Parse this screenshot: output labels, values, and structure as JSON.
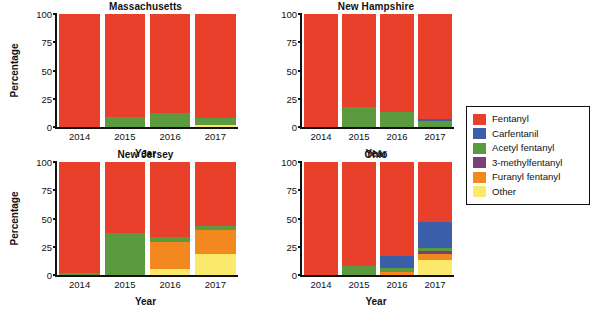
{
  "axes": {
    "ylabel": "Percentage",
    "xlabel": "Year",
    "yticks": [
      "100",
      "75",
      "50",
      "25",
      "0"
    ],
    "ytick_values": [
      100,
      75,
      50,
      25,
      0
    ],
    "xticks": [
      "2014",
      "2015",
      "2016",
      "2017"
    ]
  },
  "legend": {
    "title": "",
    "items": [
      {
        "label": "Fentanyl",
        "color": "#e8402a"
      },
      {
        "label": "Carfentanil",
        "color": "#3b5fa8"
      },
      {
        "label": "Acetyl fentanyl",
        "color": "#5b9a3e"
      },
      {
        "label": "3-methylfentanyl",
        "color": "#7b3f78"
      },
      {
        "label": "Furanyl fentanyl",
        "color": "#f2881e"
      },
      {
        "label": "Other",
        "color": "#fae96b"
      }
    ]
  },
  "caption": "",
  "chart_data": {
    "type": "bar",
    "subtype": "stacked-bar-100pct",
    "title": "",
    "xlabel": "Year",
    "ylabel": "Percentage",
    "ylim": [
      0,
      100
    ],
    "yticks": [
      0,
      25,
      50,
      75,
      100
    ],
    "grid": false,
    "legend_position": "right",
    "categories": [
      "2014",
      "2015",
      "2016",
      "2017"
    ],
    "series_order": [
      "Other",
      "Furanyl fentanyl",
      "3-methylfentanyl",
      "Acetyl fentanyl",
      "Carfentanil",
      "Fentanyl"
    ],
    "panels": [
      {
        "name": "Massachusetts",
        "series": [
          {
            "name": "Other",
            "color": "#fae96b",
            "values": [
              0,
              0,
              0,
              2
            ]
          },
          {
            "name": "Furanyl fentanyl",
            "color": "#f2881e",
            "values": [
              0,
              0,
              0,
              0
            ]
          },
          {
            "name": "3-methylfentanyl",
            "color": "#7b3f78",
            "values": [
              0,
              0,
              0,
              0
            ]
          },
          {
            "name": "Acetyl fentanyl",
            "color": "#5b9a3e",
            "values": [
              0,
              9,
              12,
              6
            ]
          },
          {
            "name": "Carfentanil",
            "color": "#3b5fa8",
            "values": [
              0,
              0,
              0,
              0
            ]
          },
          {
            "name": "Fentanyl",
            "color": "#e8402a",
            "values": [
              100,
              91,
              88,
              92
            ]
          }
        ]
      },
      {
        "name": "New Hampshire",
        "series": [
          {
            "name": "Other",
            "color": "#fae96b",
            "values": [
              0,
              0,
              0,
              0
            ]
          },
          {
            "name": "Furanyl fentanyl",
            "color": "#f2881e",
            "values": [
              0,
              0,
              0,
              0
            ]
          },
          {
            "name": "3-methylfentanyl",
            "color": "#7b3f78",
            "values": [
              0,
              0,
              0,
              0
            ]
          },
          {
            "name": "Acetyl fentanyl",
            "color": "#5b9a3e",
            "values": [
              0,
              18,
              13,
              5
            ]
          },
          {
            "name": "Carfentanil",
            "color": "#3b5fa8",
            "values": [
              0,
              0,
              0,
              2
            ]
          },
          {
            "name": "Fentanyl",
            "color": "#e8402a",
            "values": [
              100,
              82,
              87,
              93
            ]
          }
        ]
      },
      {
        "name": "New Jersey",
        "series": [
          {
            "name": "Other",
            "color": "#fae96b",
            "values": [
              0,
              0,
              5,
              19
            ]
          },
          {
            "name": "Furanyl fentanyl",
            "color": "#f2881e",
            "values": [
              0,
              0,
              24,
              21
            ]
          },
          {
            "name": "3-methylfentanyl",
            "color": "#7b3f78",
            "values": [
              0,
              0,
              0,
              0
            ]
          },
          {
            "name": "Acetyl fentanyl",
            "color": "#5b9a3e",
            "values": [
              2,
              37,
              5,
              3
            ]
          },
          {
            "name": "Carfentanil",
            "color": "#3b5fa8",
            "values": [
              0,
              0,
              0,
              0
            ]
          },
          {
            "name": "Fentanyl",
            "color": "#e8402a",
            "values": [
              98,
              63,
              66,
              57
            ]
          }
        ]
      },
      {
        "name": "Ohio",
        "series": [
          {
            "name": "Other",
            "color": "#fae96b",
            "values": [
              0,
              0,
              0,
              13
            ]
          },
          {
            "name": "Furanyl fentanyl",
            "color": "#f2881e",
            "values": [
              0,
              0,
              3,
              6
            ]
          },
          {
            "name": "3-methylfentanyl",
            "color": "#7b3f78",
            "values": [
              0,
              0,
              0,
              2
            ]
          },
          {
            "name": "Acetyl fentanyl",
            "color": "#5b9a3e",
            "values": [
              0,
              8,
              3,
              3
            ]
          },
          {
            "name": "Carfentanil",
            "color": "#3b5fa8",
            "values": [
              0,
              0,
              11,
              23
            ]
          },
          {
            "name": "Fentanyl",
            "color": "#e8402a",
            "values": [
              100,
              92,
              83,
              53
            ]
          }
        ]
      }
    ]
  }
}
